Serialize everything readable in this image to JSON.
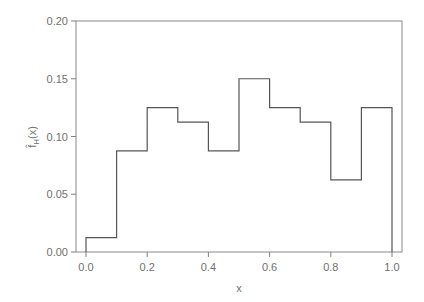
{
  "chart_data": {
    "type": "histogram-step",
    "title": "",
    "xlabel": "x",
    "ylabel": "f̂_H(x)",
    "xlim": [
      -0.03,
      1.03
    ],
    "ylim": [
      0.0,
      0.2
    ],
    "x_ticks": [
      0.0,
      0.2,
      0.4,
      0.6,
      0.8,
      1.0
    ],
    "x_tick_labels": [
      "0.0",
      "0.2",
      "0.4",
      "0.6",
      "0.8",
      "1.0"
    ],
    "y_ticks": [
      0.0,
      0.05,
      0.1,
      0.15,
      0.2
    ],
    "y_tick_labels": [
      "0.00",
      "0.05",
      "0.10",
      "0.15",
      "0.20"
    ],
    "grid": false,
    "legend": null,
    "bin_edges": [
      0.0,
      0.1,
      0.2,
      0.3,
      0.4,
      0.5,
      0.6,
      0.7,
      0.8,
      0.9,
      1.0
    ],
    "values": [
      0.0125,
      0.0875,
      0.125,
      0.1125,
      0.0875,
      0.15,
      0.125,
      0.1125,
      0.0625,
      0.125
    ],
    "line_color": "#555555",
    "axis_color": "#808080"
  },
  "axes": {
    "xlabel": "x",
    "ylabel_main": "f̂",
    "ylabel_sub": "H",
    "ylabel_arg": "(x)"
  }
}
